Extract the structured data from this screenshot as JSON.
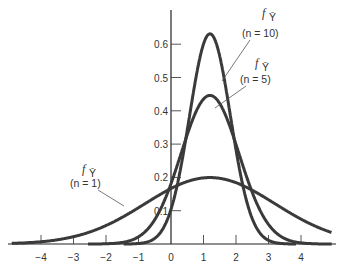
{
  "chart_data": {
    "type": "line",
    "title": "",
    "xlabel": "",
    "ylabel": "",
    "xlim": [
      -5,
      5
    ],
    "ylim": [
      0,
      0.7
    ],
    "grid": false,
    "x_ticks": [
      -4,
      -3,
      -2,
      -1,
      0,
      1,
      2,
      3,
      4
    ],
    "x_tick_labels": [
      "−4",
      "−3",
      "−2",
      "−1",
      "0",
      "1",
      "2",
      "3",
      "4"
    ],
    "y_ticks": [
      0.1,
      0.2,
      0.3,
      0.4,
      0.5,
      0.6
    ],
    "y_tick_labels": [
      "0.1",
      "0.2",
      "0.3",
      "0.4",
      "0.5",
      "0.6"
    ],
    "series": [
      {
        "name": "f_Ybar (n = 1)",
        "n": 1,
        "distribution": "normal",
        "mean": 1.2,
        "sd": 2.0,
        "peak": 0.2
      },
      {
        "name": "f_Ybar (n = 5)",
        "n": 5,
        "distribution": "normal",
        "mean": 1.2,
        "sd": 0.894,
        "peak": 0.44
      },
      {
        "name": "f_Ybar (n = 10)",
        "n": 10,
        "distribution": "normal",
        "mean": 1.2,
        "sd": 0.632,
        "peak": 0.63
      }
    ],
    "annotations": [
      {
        "label": "f",
        "subscript": "Ȳ",
        "text": "(n = 10)",
        "series": "n = 10"
      },
      {
        "label": "f",
        "subscript": "Ȳ",
        "text": "(n = 5)",
        "series": "n = 5"
      },
      {
        "label": "f",
        "subscript": "Ȳ",
        "text": "(n = 1)",
        "series": "n = 1"
      }
    ]
  },
  "labels": {
    "ann10_f": "f",
    "ann10_sub": "Ȳ",
    "ann10_n": "(n = 10)",
    "ann5_f": "f",
    "ann5_sub": "Ȳ",
    "ann5_n": "(n = 5)",
    "ann1_f": "f",
    "ann1_sub": "Ȳ",
    "ann1_n": "(n = 1)"
  },
  "colors": {
    "curve": "#3a3a3a",
    "axis": "#222222",
    "text": "#333333"
  }
}
